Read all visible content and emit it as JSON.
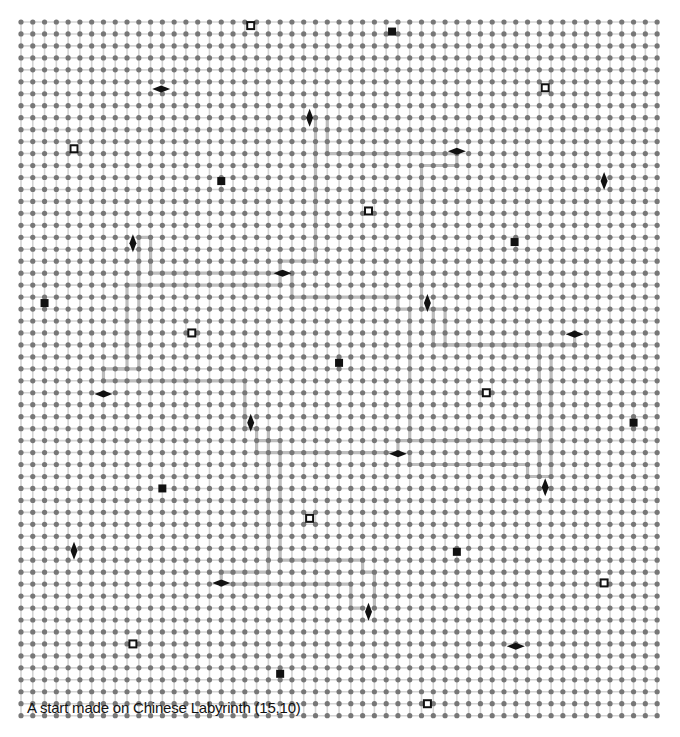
{
  "puzzle": {
    "name": "Chinese Labyrinth",
    "caption": "A start made on Chinese Labyrinth (15,10)",
    "grid": {
      "cols": 55,
      "rows": 59,
      "origin_x": 21,
      "origin_y": 22,
      "step_x": 11.78,
      "step_y": 11.96
    },
    "colors": {
      "background": "#ffffff",
      "dot": "#777777",
      "gridline": "#d4d4d4",
      "path": "#bdbdbd",
      "marker": "#111111"
    },
    "markers": [
      {
        "type": "hollow-square",
        "col": 19.5,
        "row": 0.3
      },
      {
        "type": "filled-square",
        "col": 31.5,
        "row": 0.8
      },
      {
        "type": "hollow-square",
        "col": 44.5,
        "row": 5.5
      },
      {
        "type": "diamond-horizontal",
        "col": 11.9,
        "row": 5.6
      },
      {
        "type": "hollow-square",
        "col": 4.5,
        "row": 10.6
      },
      {
        "type": "diamond-vertical",
        "col": 24.5,
        "row": 8.0
      },
      {
        "type": "diamond-horizontal",
        "col": 37.0,
        "row": 10.8
      },
      {
        "type": "diamond-vertical",
        "col": 49.5,
        "row": 13.3
      },
      {
        "type": "filled-square",
        "col": 17.0,
        "row": 13.3
      },
      {
        "type": "hollow-square",
        "col": 29.5,
        "row": 15.8
      },
      {
        "type": "filled-square",
        "col": 41.9,
        "row": 18.4
      },
      {
        "type": "diamond-vertical",
        "col": 9.5,
        "row": 18.5
      },
      {
        "type": "diamond-horizontal",
        "col": 22.2,
        "row": 21.0
      },
      {
        "type": "filled-square",
        "col": 2.0,
        "row": 23.5
      },
      {
        "type": "diamond-vertical",
        "col": 34.5,
        "row": 23.5
      },
      {
        "type": "hollow-square",
        "col": 14.5,
        "row": 26.0
      },
      {
        "type": "diamond-horizontal",
        "col": 47.0,
        "row": 26.1
      },
      {
        "type": "filled-square",
        "col": 27.0,
        "row": 28.5
      },
      {
        "type": "diamond-horizontal",
        "col": 7.0,
        "row": 31.1
      },
      {
        "type": "hollow-square",
        "col": 39.5,
        "row": 31.0
      },
      {
        "type": "diamond-vertical",
        "col": 19.5,
        "row": 33.5
      },
      {
        "type": "filled-square",
        "col": 52.0,
        "row": 33.5
      },
      {
        "type": "diamond-horizontal",
        "col": 32.0,
        "row": 36.1
      },
      {
        "type": "filled-square",
        "col": 12.0,
        "row": 39.0
      },
      {
        "type": "diamond-vertical",
        "col": 44.5,
        "row": 38.9
      },
      {
        "type": "hollow-square",
        "col": 24.5,
        "row": 41.5
      },
      {
        "type": "diamond-vertical",
        "col": 4.5,
        "row": 44.2
      },
      {
        "type": "filled-square",
        "col": 37.0,
        "row": 44.3
      },
      {
        "type": "diamond-horizontal",
        "col": 17.0,
        "row": 46.9
      },
      {
        "type": "hollow-square",
        "col": 49.5,
        "row": 46.9
      },
      {
        "type": "diamond-vertical",
        "col": 29.5,
        "row": 49.3
      },
      {
        "type": "hollow-square",
        "col": 9.5,
        "row": 52.0
      },
      {
        "type": "diamond-horizontal",
        "col": 42.0,
        "row": 52.2
      },
      {
        "type": "filled-square",
        "col": 22.0,
        "row": 54.5
      },
      {
        "type": "hollow-square",
        "col": 34.5,
        "row": 57.0
      }
    ],
    "paths": [
      [
        [
          25,
          8
        ],
        [
          25,
          20
        ],
        [
          22,
          20
        ],
        [
          22,
          22
        ],
        [
          9,
          22
        ],
        [
          9,
          29
        ],
        [
          7,
          29
        ],
        [
          7,
          30
        ]
      ],
      [
        [
          26,
          8
        ],
        [
          26,
          11
        ],
        [
          37,
          11
        ],
        [
          37,
          12
        ],
        [
          34,
          12
        ],
        [
          34,
          24
        ],
        [
          36,
          24
        ],
        [
          36,
          27
        ],
        [
          44,
          27
        ],
        [
          44,
          38
        ],
        [
          43,
          38
        ]
      ],
      [
        [
          10,
          18
        ],
        [
          11,
          18
        ],
        [
          11,
          21
        ],
        [
          22,
          21
        ]
      ],
      [
        [
          10,
          18
        ],
        [
          10,
          29
        ],
        [
          8,
          29
        ]
      ],
      [
        [
          7,
          30
        ],
        [
          19,
          30
        ],
        [
          19,
          34
        ],
        [
          20,
          34
        ]
      ],
      [
        [
          21,
          34
        ],
        [
          21,
          46
        ],
        [
          17,
          46
        ],
        [
          17,
          47
        ]
      ],
      [
        [
          17,
          47
        ],
        [
          28,
          47
        ],
        [
          28,
          49
        ],
        [
          29,
          49
        ]
      ],
      [
        [
          20,
          34
        ],
        [
          20,
          35
        ],
        [
          22,
          35
        ],
        [
          22,
          45
        ]
      ],
      [
        [
          23,
          21
        ],
        [
          23,
          23
        ],
        [
          32,
          23
        ],
        [
          32,
          24
        ],
        [
          33,
          24
        ]
      ],
      [
        [
          22,
          45
        ],
        [
          29,
          45
        ],
        [
          29,
          46
        ],
        [
          30,
          46
        ],
        [
          30,
          49
        ]
      ],
      [
        [
          35,
          24
        ],
        [
          35,
          27
        ],
        [
          47,
          27
        ],
        [
          47,
          26
        ]
      ],
      [
        [
          45,
          28
        ],
        [
          45,
          38
        ],
        [
          44,
          38
        ]
      ],
      [
        [
          32,
          36
        ],
        [
          32,
          35
        ],
        [
          44,
          35
        ],
        [
          44,
          36
        ]
      ],
      [
        [
          33,
          36
        ],
        [
          33,
          37
        ],
        [
          43,
          37
        ],
        [
          43,
          38
        ]
      ],
      [
        [
          20,
          35
        ],
        [
          20,
          36
        ],
        [
          32,
          36
        ]
      ],
      [
        [
          33,
          24
        ],
        [
          33,
          35
        ]
      ]
    ]
  }
}
